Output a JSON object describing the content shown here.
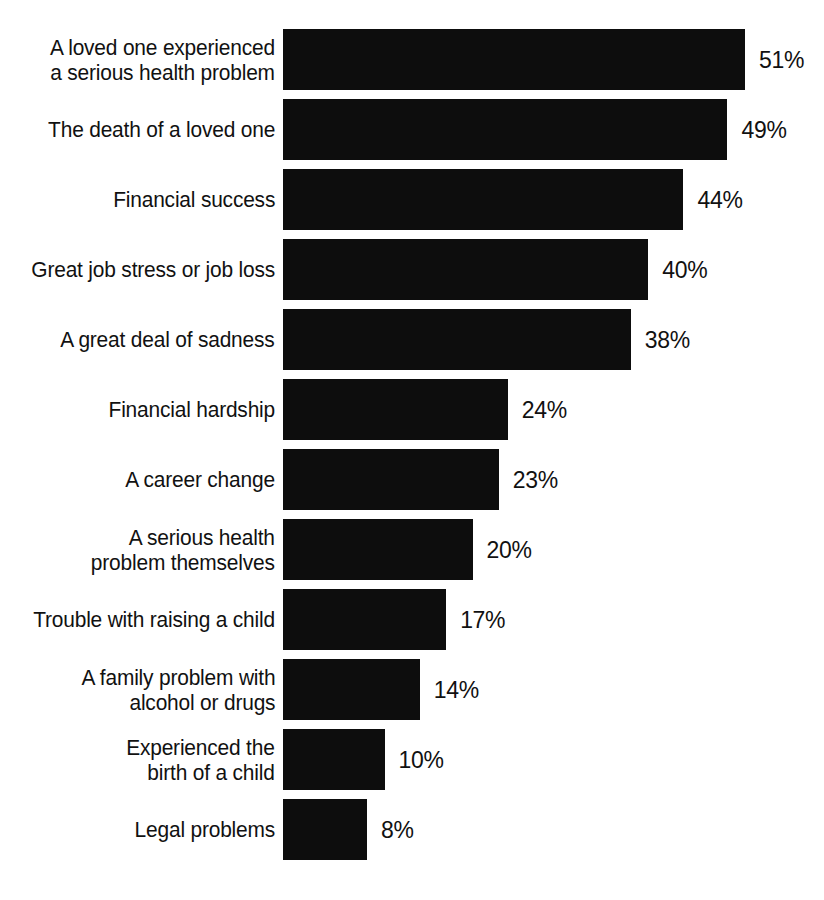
{
  "chart_data": {
    "type": "bar",
    "orientation": "horizontal",
    "title": "",
    "subtitle": "",
    "xlabel": "",
    "ylabel": "",
    "grid": false,
    "legend": null,
    "axis_visible": false,
    "value_suffix": "%",
    "xlim": [
      0,
      51
    ],
    "categories": [
      "A loved one experienced\na serious health problem",
      "The death of a loved one",
      "Financial success",
      "Great job stress or job loss",
      "A great deal of sadness",
      "Financial hardship",
      "A career change",
      "A serious health\nproblem themselves",
      "Trouble with raising a child",
      "A family problem with\nalcohol or drugs",
      "Experienced the\nbirth of a child",
      "Legal problems"
    ],
    "values": [
      51,
      49,
      44,
      40,
      38,
      24,
      23,
      20,
      17,
      14,
      10,
      8
    ],
    "value_labels": [
      "51%",
      "49%",
      "44%",
      "40%",
      "38%",
      "24%",
      "23%",
      "20%",
      "17%",
      "14%",
      "10%",
      "8%"
    ],
    "bar_color": "#0d0d0d",
    "background_color": "#ffffff",
    "text_color": "#111111"
  },
  "layout": {
    "bar_start_x": 283,
    "row_pitch": 70,
    "bar_height": 61,
    "first_row_top": 29,
    "px_per_percent": 8.79,
    "px_intercept": 13.7,
    "value_gap": 14
  }
}
